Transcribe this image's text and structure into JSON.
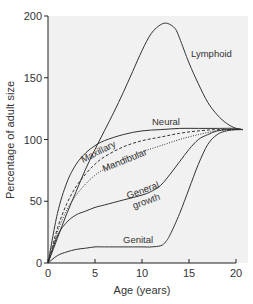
{
  "chart_data": {
    "type": "line",
    "title": "",
    "xlabel": "Age (years)",
    "ylabel": "Percentage of adult size",
    "xlim": [
      0,
      20.7
    ],
    "ylim": [
      0,
      200
    ],
    "xticks": [
      0,
      5,
      10,
      15,
      20
    ],
    "yticks": [
      0,
      50,
      100,
      150,
      200
    ],
    "grid": false,
    "legend": "inline labels",
    "plot_background": "#f1f1f1",
    "series": [
      {
        "name": "Lymphoid",
        "style": "solid",
        "x": [
          0,
          1,
          2,
          3,
          4,
          5,
          6,
          7,
          8,
          9,
          10,
          11,
          12,
          12.7,
          13.5,
          14,
          15,
          16,
          17,
          18,
          19,
          20,
          20.7
        ],
        "y": [
          0,
          20,
          40,
          58,
          76,
          92,
          107,
          122,
          138,
          155,
          172,
          186,
          193,
          194,
          190,
          182,
          162,
          145,
          130,
          120,
          113,
          109,
          108
        ]
      },
      {
        "name": "Neural",
        "style": "solid",
        "x": [
          0,
          1,
          2,
          3,
          4,
          5,
          6,
          8,
          10,
          12,
          14,
          16,
          18,
          20,
          20.7
        ],
        "y": [
          0,
          40,
          65,
          80,
          89,
          95,
          99,
          104,
          107,
          108,
          109,
          109,
          109,
          109,
          108
        ]
      },
      {
        "name": "Maxillary",
        "style": "dashed",
        "x": [
          0,
          1,
          2,
          3,
          4,
          5,
          6,
          8,
          10,
          12,
          14,
          16,
          18,
          20,
          20.7
        ],
        "y": [
          0,
          28,
          48,
          62,
          72,
          80,
          86,
          94,
          99,
          102,
          105,
          107,
          108,
          108,
          108
        ]
      },
      {
        "name": "Mandibular",
        "style": "dotted",
        "x": [
          0,
          1,
          2,
          3,
          4,
          5,
          6,
          8,
          10,
          12,
          14,
          16,
          18,
          20,
          20.7
        ],
        "y": [
          0,
          25,
          43,
          55,
          64,
          71,
          76,
          84,
          90,
          95,
          100,
          104,
          107,
          108,
          108
        ]
      },
      {
        "name": "General growth",
        "style": "solid",
        "x": [
          0,
          1,
          2,
          3,
          4,
          5,
          6,
          8,
          10,
          11,
          12,
          13,
          14,
          15,
          16,
          17,
          18,
          19,
          20,
          20.7
        ],
        "y": [
          0,
          22,
          33,
          39,
          42,
          45,
          47,
          51,
          55,
          58,
          63,
          72,
          82,
          92,
          100,
          104,
          107,
          108,
          108,
          108
        ]
      },
      {
        "name": "Genital",
        "style": "solid",
        "x": [
          0,
          1,
          2,
          3,
          4,
          5,
          6,
          8,
          10,
          11,
          12,
          12.5,
          13,
          14,
          15,
          16,
          17,
          18,
          19,
          20,
          20.7
        ],
        "y": [
          0,
          6,
          9,
          11,
          12,
          13,
          13,
          13,
          13,
          13,
          14,
          17,
          23,
          40,
          60,
          80,
          96,
          104,
          107,
          108,
          108
        ]
      }
    ],
    "annotations": [
      {
        "text": "Lymphoid",
        "x": 15.5,
        "y": 155
      },
      {
        "text": "Neural",
        "x": 14,
        "y": 114
      },
      {
        "text": "Maxillary",
        "x": 8,
        "y": 89,
        "rotation": -26
      },
      {
        "text": "Mandibular",
        "x": 11,
        "y": 80,
        "rotation": -20
      },
      {
        "text": "General",
        "x": 11.4,
        "y": 57,
        "rotation": -20
      },
      {
        "text": "growth",
        "x": 12,
        "y": 48,
        "rotation": -20
      },
      {
        "text": "Genital",
        "x": 10.2,
        "y": 15
      }
    ]
  },
  "axes": {
    "x_title": "Age (years)",
    "y_title": "Percentage of adult size",
    "x_tick_labels": [
      "0",
      "5",
      "10",
      "15",
      "20"
    ],
    "y_tick_labels": [
      "0",
      "50",
      "100",
      "150",
      "200"
    ]
  },
  "labels": {
    "lymphoid": "Lymphoid",
    "neural": "Neural",
    "maxillary": "Maxillary",
    "mandibular": "Mandibular",
    "general": "General",
    "growth": "growth",
    "genital": "Genital"
  },
  "colors": {
    "line": "#333333",
    "background": "#f1f1f1",
    "axis": "#222222"
  }
}
